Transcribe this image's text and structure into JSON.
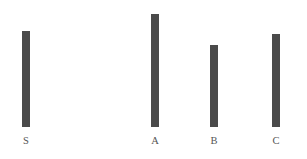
{
  "chart_data": {
    "type": "bar",
    "title": "",
    "subtitle": "",
    "xlabel": "",
    "ylabel": "",
    "categories": [
      "S",
      "A",
      "B",
      "C"
    ],
    "values": [
      96,
      113,
      82,
      93
    ],
    "ylim": [
      0,
      127
    ],
    "grid": false,
    "legend": null,
    "annotations": [],
    "bar_color": "#4a4a4a",
    "background_color": "#ffffff",
    "label_color": "#555555",
    "bars": [
      {
        "label": "S",
        "value": 96,
        "x": 22,
        "width": 8,
        "top": 31,
        "bottom": 127
      },
      {
        "label": "A",
        "value": 113,
        "x": 151,
        "width": 8,
        "top": 14,
        "bottom": 127
      },
      {
        "label": "B",
        "value": 82,
        "x": 210,
        "width": 8,
        "top": 45,
        "bottom": 127
      },
      {
        "label": "C",
        "value": 93,
        "x": 272,
        "width": 8,
        "top": 34,
        "bottom": 127
      }
    ],
    "label_positions": [
      {
        "label": "S",
        "center_x": 26,
        "baseline_y": 145
      },
      {
        "label": "A",
        "center_x": 155,
        "baseline_y": 145
      },
      {
        "label": "B",
        "center_x": 214,
        "baseline_y": 145
      },
      {
        "label": "C",
        "center_x": 276,
        "baseline_y": 145
      }
    ]
  }
}
